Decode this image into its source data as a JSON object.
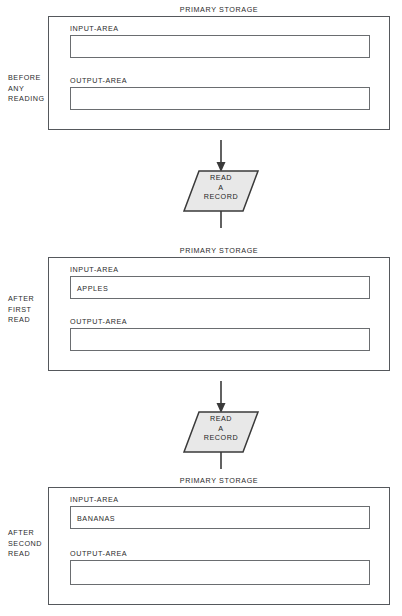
{
  "diagram": {
    "storage_title": "PRIMARY STORAGE",
    "input_area_label": "INPUT-AREA",
    "output_area_label": "OUTPUT-AREA",
    "stages": [
      {
        "stage_label": "BEFORE\nANY\nREADING",
        "stage_label_lines": [
          "BEFORE",
          "ANY",
          "READING"
        ],
        "storage_title": "PRIMARY STORAGE",
        "input_label": "INPUT-AREA",
        "input_value": "",
        "output_label": "OUTPUT-AREA",
        "output_value": ""
      },
      {
        "stage_label": "AFTER\nFIRST\nREAD",
        "stage_label_lines": [
          "AFTER",
          "FIRST",
          "READ"
        ],
        "storage_title": "PRIMARY STORAGE",
        "input_label": "INPUT-AREA",
        "input_value": "APPLES",
        "output_label": "OUTPUT-AREA",
        "output_value": ""
      },
      {
        "stage_label": "AFTER\nSECOND\nREAD",
        "stage_label_lines": [
          "AFTER",
          "SECOND",
          "READ"
        ],
        "storage_title": "PRIMARY STORAGE",
        "input_label": "INPUT-AREA",
        "input_value": "BANANAS",
        "output_label": "OUTPUT-AREA",
        "output_value": ""
      }
    ],
    "operations": [
      {
        "lines": [
          "READ",
          "A",
          "RECORD"
        ],
        "text": "READ A RECORD"
      },
      {
        "lines": [
          "READ",
          "A",
          "RECORD"
        ],
        "text": "READ A RECORD"
      }
    ],
    "colors": {
      "background": "#ffffff",
      "outer_border": "#55585c",
      "inner_border": "#6a6d70",
      "symbol_fill": "#e8e8e8",
      "symbol_border": "#3a3a3a",
      "text": "#2b2b2b"
    }
  }
}
